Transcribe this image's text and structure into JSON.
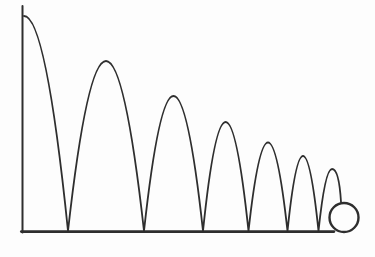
{
  "figure": {
    "background_color": "#fdfdfd",
    "stroke_color": "#2e2e2e",
    "canvas": {
      "width": 375,
      "height": 257
    },
    "axes": {
      "y_axis": {
        "x1": 22.5,
        "y1": 6,
        "x2": 22.5,
        "y2": 232.5,
        "stroke_width": 2
      },
      "ground": {
        "x1": 21.3,
        "y1": 231.6,
        "x2": 334,
        "y2": 231.6,
        "stroke_width": 2.6
      }
    },
    "trajectory": {
      "start_point": {
        "x": 24,
        "y": 16
      },
      "bounce_points_x": [
        68,
        144,
        203,
        248.5,
        287.5,
        318.5
      ],
      "peaks": [
        {
          "x": 107,
          "y": 61
        },
        {
          "x": 174,
          "y": 96
        },
        {
          "x": 226,
          "y": 122
        },
        {
          "x": 269,
          "y": 142.5
        },
        {
          "x": 303,
          "y": 156
        },
        {
          "x": 332,
          "y": 169
        }
      ],
      "end_point": {
        "x": 341,
        "y": 202
      },
      "path_d": "M 24 16 Q 46 16 68 231 Q 106 -109 144 231 Q 173.5 -39 203 231 Q 225.5 13 248.5 231 Q 268 54 287.5 231 Q 303 81 318.5 231 Q 325 169 332 169 Q 339 169 341 202",
      "stroke_width": 1.8
    },
    "ball": {
      "cx": 344,
      "cy": 217.5,
      "r": 14.5,
      "stroke_width": 2.4
    }
  }
}
